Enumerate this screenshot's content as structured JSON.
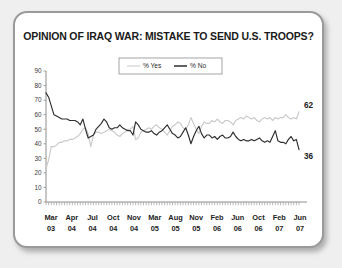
{
  "chart_data": {
    "type": "line",
    "title": "OPINION OF IRAQ WAR: MISTAKE TO SEND U.S. TROOPS?",
    "xlabel": "",
    "ylabel": "",
    "ylim": [
      0,
      90
    ],
    "ytick_step": 10,
    "yticks": [
      0,
      10,
      20,
      30,
      40,
      50,
      60,
      70,
      80,
      90
    ],
    "grid": false,
    "legend_position": "top-center",
    "x_tick_labels": [
      {
        "month": "Mar",
        "year": "03"
      },
      {
        "month": "Apr",
        "year": "04"
      },
      {
        "month": "Jul",
        "year": "04"
      },
      {
        "month": "Oct",
        "year": "04"
      },
      {
        "month": "Nov",
        "year": "04"
      },
      {
        "month": "Mar",
        "year": "05"
      },
      {
        "month": "Aug",
        "year": "05"
      },
      {
        "month": "Nov",
        "year": "05"
      },
      {
        "month": "Feb",
        "year": "06"
      },
      {
        "month": "Jun",
        "year": "06"
      },
      {
        "month": "Oct",
        "year": "06"
      },
      {
        "month": "Feb",
        "year": "07"
      },
      {
        "month": "Jun",
        "year": "07"
      }
    ],
    "series": [
      {
        "name": "% Yes",
        "color": "#c9c9c9",
        "end_label": "62",
        "values": [
          23,
          29,
          38,
          38,
          39,
          41,
          41,
          42,
          42,
          43,
          43,
          44,
          45,
          47,
          50,
          51,
          47,
          38,
          46,
          48,
          48,
          47,
          48,
          49,
          50,
          49,
          48,
          46,
          45,
          47,
          48,
          50,
          50,
          52,
          43,
          44,
          48,
          49,
          50,
          51,
          50,
          52,
          53,
          51,
          50,
          48,
          46,
          49,
          52,
          53,
          55,
          54,
          51,
          50,
          53,
          58,
          54,
          50,
          47,
          52,
          55,
          54,
          54,
          56,
          55,
          57,
          55,
          54,
          56,
          56,
          55,
          53,
          56,
          57,
          58,
          57,
          59,
          58,
          57,
          58,
          56,
          55,
          57,
          58,
          57,
          58,
          56,
          58,
          57,
          58,
          58,
          60,
          58,
          57,
          58,
          57,
          62
        ]
      },
      {
        "name": "% No",
        "color": "#2e2e2e",
        "end_label": "36",
        "values": [
          75,
          72,
          66,
          60,
          59,
          58,
          57,
          57,
          57,
          56,
          56,
          56,
          55,
          53,
          57,
          50,
          44,
          45,
          46,
          50,
          52,
          54,
          57,
          55,
          51,
          50,
          51,
          51,
          53,
          51,
          50,
          49,
          49,
          46,
          55,
          53,
          50,
          49,
          48,
          48,
          49,
          47,
          46,
          48,
          49,
          51,
          53,
          50,
          47,
          46,
          44,
          45,
          48,
          51,
          46,
          40,
          45,
          49,
          52,
          47,
          44,
          46,
          46,
          44,
          45,
          43,
          45,
          46,
          44,
          44,
          45,
          48,
          45,
          43,
          42,
          43,
          42,
          42,
          43,
          42,
          43,
          44,
          42,
          41,
          42,
          41,
          45,
          49,
          42,
          41,
          41,
          40,
          43,
          45,
          42,
          43,
          36
        ]
      }
    ]
  },
  "legend": {
    "items": [
      {
        "label": "% Yes"
      },
      {
        "label": "% No"
      }
    ]
  },
  "colors": {
    "yes_line": "#c9c9c9",
    "no_line": "#2e2e2e",
    "axis": "#8e8e8e",
    "frame": "#9a9a9a",
    "page_background": "#efefef",
    "card_background": "#ffffff"
  }
}
